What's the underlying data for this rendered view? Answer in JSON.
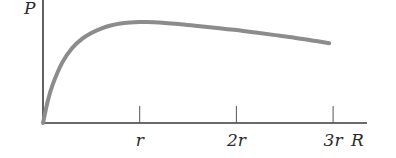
{
  "chart_data": {
    "type": "line",
    "title": "",
    "xlabel": "R",
    "ylabel": "P",
    "x_tick_labels": [
      "r",
      "2r",
      "3r"
    ],
    "x_ticks": [
      1,
      2,
      3
    ],
    "xlim": [
      0,
      3.35
    ],
    "ylim": [
      0,
      1.22
    ],
    "grid": false,
    "legend": null,
    "series": [
      {
        "name": "P(R)",
        "color": "#8c8c8c",
        "x": [
          0,
          0.05,
          0.1,
          0.2,
          0.3,
          0.4,
          0.5,
          0.6,
          0.7,
          0.8,
          0.9,
          1.0,
          1.06,
          1.2,
          1.4,
          1.6,
          1.8,
          2.0,
          2.2,
          2.4,
          2.6,
          2.8,
          2.96
        ],
        "values": [
          0,
          0.22,
          0.38,
          0.6,
          0.74,
          0.83,
          0.89,
          0.935,
          0.965,
          0.985,
          0.995,
          1.0,
          1.0,
          0.995,
          0.98,
          0.96,
          0.94,
          0.92,
          0.895,
          0.87,
          0.845,
          0.815,
          0.79
        ]
      }
    ],
    "axis_color": "#3a3a3a"
  }
}
